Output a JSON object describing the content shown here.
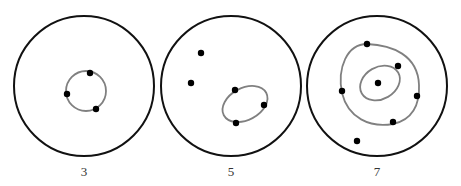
{
  "colors": {
    "outer": "#111111",
    "contour": "#808080",
    "dot": "#000000"
  },
  "panels": [
    {
      "label": "3",
      "outer": {
        "cx": 84,
        "cy": 86,
        "r": 70
      },
      "contours": [
        {
          "cx": 86,
          "cy": 91,
          "rx": 20,
          "ry": 20,
          "rot": 0
        }
      ],
      "dots": [
        [
          90,
          73
        ],
        [
          67,
          94
        ],
        [
          96,
          109
        ]
      ],
      "label_x": 84
    },
    {
      "label": "5",
      "outer": {
        "cx": 231,
        "cy": 86,
        "r": 70
      },
      "contours": [
        {
          "cx": 245,
          "cy": 104,
          "rx": 24,
          "ry": 16,
          "rot": -28
        }
      ],
      "dots": [
        [
          201,
          53
        ],
        [
          191,
          83
        ],
        [
          235,
          90
        ],
        [
          264,
          105
        ],
        [
          236,
          123
        ]
      ],
      "label_x": 231
    },
    {
      "label": "7",
      "outer": {
        "cx": 377,
        "cy": 86,
        "r": 70
      },
      "contours": [
        {
          "cx": 380,
          "cy": 84,
          "rx": 40,
          "ry": 40,
          "rot": 0,
          "path": "M367,44 C392,45 418,55 419,85 C420,105 412,120 393,124 C370,128 348,118 342,93 C337,68 347,44 367,44 Z"
        },
        {
          "cx": 380,
          "cy": 83,
          "rx": 21,
          "ry": 16,
          "rot": -30
        }
      ],
      "dots": [
        [
          367,
          44
        ],
        [
          398,
          66
        ],
        [
          378,
          83
        ],
        [
          342,
          91
        ],
        [
          417,
          96
        ],
        [
          393,
          122
        ],
        [
          357,
          141
        ]
      ],
      "label_x": 377
    }
  ]
}
